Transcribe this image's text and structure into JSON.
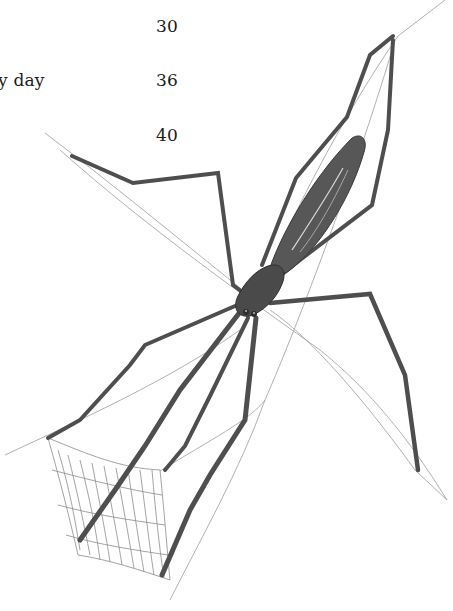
{
  "page": {
    "type": "book-page-fragment",
    "text_rows": [
      {
        "label": "",
        "value": "30"
      },
      {
        "label": "y day",
        "value": "36"
      },
      {
        "label": "",
        "value": "40"
      }
    ]
  },
  "illustration": {
    "subject": "net-casting spider holding silk net",
    "style": "pencil drawing, grayscale",
    "colors": {
      "body": "#4a4a4a",
      "legs": "#555555",
      "silk": "#9a9a9a",
      "net": "#8c8c8c"
    }
  }
}
